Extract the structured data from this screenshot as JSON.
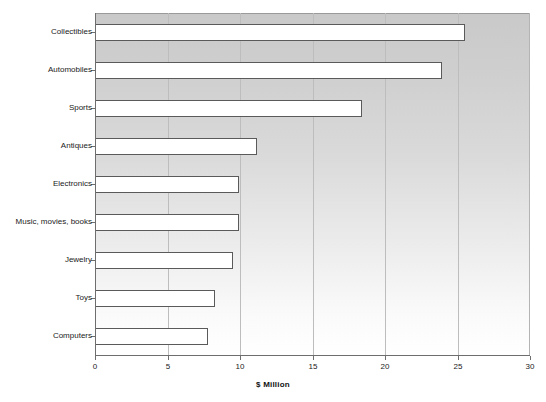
{
  "chart_data": {
    "type": "bar",
    "orientation": "horizontal",
    "title": "",
    "xlabel": "$ Million",
    "ylabel": "",
    "xlim": [
      0,
      30
    ],
    "xticks": [
      0,
      5,
      10,
      15,
      20,
      25,
      30
    ],
    "xtick_labels": [
      "0",
      "5",
      "10",
      "15",
      "20",
      "25",
      "30"
    ],
    "grid": true,
    "grid_axis": "x",
    "legend": false,
    "categories": [
      "Collectibles",
      "Automobiles",
      "Sports",
      "Antiques",
      "Electronics",
      "Music, movies, books",
      "Jewelry",
      "Toys",
      "Computers"
    ],
    "values": [
      25.5,
      23.9,
      18.4,
      11.2,
      9.9,
      9.9,
      9.5,
      8.3,
      7.8
    ],
    "series": [
      {
        "name": "$ Million",
        "values": [
          25.5,
          23.9,
          18.4,
          11.2,
          9.9,
          9.9,
          9.5,
          8.3,
          7.8
        ]
      }
    ],
    "bar_fill_color": "#ffffff",
    "bar_border_color": "#5a5a5a",
    "plot_background_gradient": [
      "#c9c9c9",
      "#ffffff"
    ],
    "gridline_color": "#bdbdbd",
    "axis_color": "#6e6e6e",
    "text_color": "#1a1a1a"
  }
}
